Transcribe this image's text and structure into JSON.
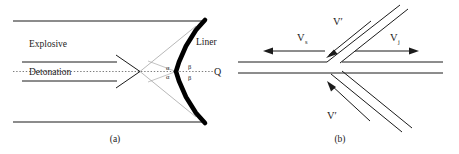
{
  "figure": {
    "panel_a": {
      "caption": "(a)",
      "labels": {
        "explosive": "Explosive",
        "detonation": "Detonation",
        "liner": "Liner",
        "axis_point": "Q",
        "angle_alpha_upper": "α",
        "angle_alpha_lower": "α",
        "angle_beta_upper": "β",
        "angle_beta_lower": "β"
      }
    },
    "panel_b": {
      "caption": "(b)",
      "labels": {
        "v_s_symbol": "V",
        "v_s_subscript": "s",
        "v_j_symbol": "V",
        "v_j_subscript": "j",
        "v_prime_upper": "V′",
        "v_prime_lower": "V′"
      }
    },
    "colors": {
      "line": "#1b1b1b",
      "liner_fill": "#000000",
      "guide": "#8c8c8c",
      "dotted_axis": "#6e6e6e",
      "background": "#ffffff"
    }
  }
}
